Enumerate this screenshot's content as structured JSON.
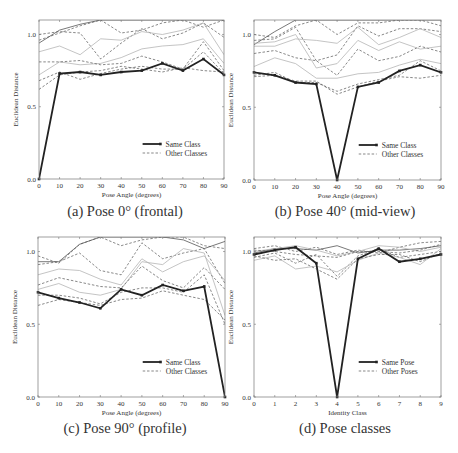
{
  "figure": {
    "captions": [
      "(a) Pose 0° (frontal)",
      "(b) Pose 40° (mid-view)",
      "(c) Pose 90° (profile)",
      "(d) Pose classes"
    ]
  },
  "chart_data": [
    {
      "type": "line",
      "title": "(a) Pose 0° (frontal)",
      "xlabel": "Pose Angle (degrees)",
      "ylabel": "Euclidean Distance",
      "x": [
        0,
        10,
        20,
        30,
        40,
        50,
        60,
        70,
        80,
        90
      ],
      "xticks": [
        "0",
        "10",
        "20",
        "30",
        "40",
        "50",
        "60",
        "70",
        "80",
        "90"
      ],
      "yticks": [
        "0.0",
        "0.5",
        "1.0"
      ],
      "ylim": [
        0,
        1.1
      ],
      "legend": [
        "Same Class",
        "Other Classes"
      ],
      "legend_position": "lower right",
      "grid": false,
      "series": [
        {
          "name": "Same Class",
          "style": "bold",
          "values": [
            0.0,
            0.73,
            0.74,
            0.72,
            0.74,
            0.75,
            0.8,
            0.75,
            0.83,
            0.72
          ]
        },
        {
          "name": "Other Classes",
          "style": "solid-dark",
          "values": [
            0.94,
            1.03,
            1.07,
            1.1,
            1.1,
            1.1,
            1.1,
            1.1,
            1.1,
            1.1
          ]
        },
        {
          "name": "Other Classes",
          "style": "dashed",
          "values": [
            1.0,
            1.02,
            1.01,
            0.83,
            0.94,
            1.04,
            0.97,
            1.01,
            1.08,
            0.98
          ]
        },
        {
          "name": "Other Classes",
          "style": "dashed",
          "values": [
            0.96,
            1.01,
            1.06,
            1.1,
            1.01,
            1.03,
            1.08,
            1.1,
            1.05,
            1.1
          ]
        },
        {
          "name": "Other Classes",
          "style": "light",
          "values": [
            0.88,
            0.92,
            0.86,
            0.97,
            0.96,
            1.02,
            1.0,
            1.03,
            1.08,
            0.86
          ]
        },
        {
          "name": "Other Classes",
          "style": "light",
          "values": [
            0.72,
            0.81,
            0.79,
            0.8,
            0.84,
            0.9,
            0.92,
            0.93,
            0.97,
            0.8
          ]
        },
        {
          "name": "Other Classes",
          "style": "dashed",
          "values": [
            0.81,
            0.81,
            0.82,
            0.79,
            0.8,
            0.85,
            0.81,
            0.76,
            0.95,
            0.75
          ]
        },
        {
          "name": "Other Classes",
          "style": "dashed",
          "values": [
            0.68,
            0.74,
            0.69,
            0.73,
            0.76,
            0.78,
            0.76,
            0.76,
            0.88,
            0.73
          ]
        },
        {
          "name": "Other Classes",
          "style": "dashed",
          "values": [
            0.62,
            0.72,
            0.74,
            0.75,
            0.78,
            0.76,
            0.74,
            0.77,
            0.75,
            0.74
          ]
        }
      ]
    },
    {
      "type": "line",
      "title": "(b) Pose 40° (mid-view)",
      "xlabel": "Pose Angle (degrees)",
      "ylabel": "Euclidean Distance",
      "x": [
        0,
        10,
        20,
        30,
        40,
        50,
        60,
        70,
        80,
        90
      ],
      "xticks": [
        "0",
        "10",
        "20",
        "30",
        "40",
        "50",
        "60",
        "70",
        "80",
        "90"
      ],
      "yticks": [
        "0.0",
        "0.5",
        "1.0"
      ],
      "ylim": [
        0,
        1.1
      ],
      "legend": [
        "Same Class",
        "Other Classes"
      ],
      "legend_position": "lower right",
      "grid": false,
      "series": [
        {
          "name": "Same Class",
          "style": "bold",
          "values": [
            0.74,
            0.72,
            0.67,
            0.66,
            0.0,
            0.64,
            0.67,
            0.75,
            0.79,
            0.74
          ]
        },
        {
          "name": "Other Classes",
          "style": "solid-dark",
          "values": [
            0.93,
            1.02,
            1.1,
            1.1,
            1.1,
            1.1,
            1.1,
            1.1,
            1.1,
            1.1
          ]
        },
        {
          "name": "Other Classes",
          "style": "dashed",
          "values": [
            1.0,
            0.98,
            1.06,
            1.1,
            1.0,
            1.08,
            1.08,
            1.1,
            1.1,
            1.06
          ]
        },
        {
          "name": "Other Classes",
          "style": "dashed",
          "values": [
            0.96,
            0.97,
            1.05,
            0.82,
            0.86,
            1.06,
            0.99,
            1.04,
            1.04,
            1.02
          ]
        },
        {
          "name": "Other Classes",
          "style": "light",
          "values": [
            0.92,
            0.92,
            0.97,
            0.96,
            0.94,
            1.05,
            0.93,
            0.98,
            1.04,
            0.98
          ]
        },
        {
          "name": "Other Classes",
          "style": "light",
          "values": [
            0.78,
            0.84,
            0.8,
            0.7,
            0.7,
            0.73,
            0.74,
            0.79,
            0.83,
            0.8
          ]
        },
        {
          "name": "Other Classes",
          "style": "dashed",
          "values": [
            0.87,
            0.89,
            0.84,
            0.82,
            0.72,
            0.9,
            0.82,
            0.85,
            0.92,
            0.88
          ]
        },
        {
          "name": "Other Classes",
          "style": "light",
          "values": [
            0.94,
            0.95,
            1.0,
            0.77,
            0.8,
            0.96,
            0.89,
            0.95,
            0.9,
            0.92
          ]
        },
        {
          "name": "Other Classes",
          "style": "dashed",
          "values": [
            0.72,
            0.74,
            0.67,
            0.67,
            0.61,
            0.66,
            0.69,
            0.72,
            0.82,
            0.75
          ]
        },
        {
          "name": "Other Classes",
          "style": "dashed",
          "values": [
            0.71,
            0.72,
            0.68,
            0.68,
            0.59,
            0.64,
            0.68,
            0.71,
            0.7,
            0.72
          ]
        }
      ]
    },
    {
      "type": "line",
      "title": "(c) Pose 90° (profile)",
      "xlabel": "Pose Angle (degrees)",
      "ylabel": "Euclidean Distance",
      "x": [
        0,
        10,
        20,
        30,
        40,
        50,
        60,
        70,
        80,
        90
      ],
      "xticks": [
        "0",
        "10",
        "20",
        "30",
        "40",
        "50",
        "60",
        "70",
        "80",
        "90"
      ],
      "yticks": [
        "0.0",
        "0.5",
        "1.0"
      ],
      "ylim": [
        0,
        1.1
      ],
      "legend": [
        "Same Class",
        "Other Classes"
      ],
      "legend_position": "lower right",
      "grid": false,
      "series": [
        {
          "name": "Same Class",
          "style": "bold",
          "values": [
            0.72,
            0.68,
            0.65,
            0.61,
            0.74,
            0.7,
            0.77,
            0.73,
            0.76,
            0.0
          ]
        },
        {
          "name": "Other Classes",
          "style": "solid-dark",
          "values": [
            0.93,
            0.93,
            1.05,
            1.1,
            1.1,
            1.1,
            1.1,
            1.08,
            1.02,
            1.07
          ]
        },
        {
          "name": "Other Classes",
          "style": "dashed",
          "values": [
            0.97,
            0.92,
            1.05,
            1.1,
            1.04,
            1.08,
            1.1,
            1.1,
            1.04,
            1.02
          ]
        },
        {
          "name": "Other Classes",
          "style": "dashed",
          "values": [
            0.91,
            0.93,
            0.99,
            0.87,
            0.84,
            1.06,
            0.95,
            0.99,
            1.02,
            0.78
          ]
        },
        {
          "name": "Other Classes",
          "style": "light",
          "values": [
            0.84,
            0.88,
            0.87,
            0.81,
            0.77,
            0.95,
            0.86,
            0.93,
            0.97,
            0.8
          ]
        },
        {
          "name": "Other Classes",
          "style": "light",
          "values": [
            0.74,
            0.78,
            0.72,
            0.7,
            0.74,
            0.93,
            0.91,
            1.02,
            0.99,
            0.56
          ]
        },
        {
          "name": "Other Classes",
          "style": "dashed",
          "values": [
            0.77,
            0.82,
            0.79,
            0.76,
            0.75,
            0.9,
            0.8,
            0.75,
            0.89,
            0.74
          ]
        },
        {
          "name": "Other Classes",
          "style": "dashed",
          "values": [
            0.7,
            0.7,
            0.68,
            0.64,
            0.72,
            0.75,
            0.75,
            0.72,
            0.84,
            0.5
          ]
        },
        {
          "name": "Other Classes",
          "style": "dashed",
          "values": [
            0.63,
            0.67,
            0.65,
            0.63,
            0.67,
            0.68,
            0.73,
            0.7,
            0.67,
            0.53
          ]
        }
      ]
    },
    {
      "type": "line",
      "title": "(d) Pose classes",
      "xlabel": "Identity Class",
      "ylabel": "Euclidean Distance",
      "x": [
        0,
        1,
        2,
        3,
        4,
        5,
        6,
        7,
        8,
        9
      ],
      "xticks": [
        "0",
        "1",
        "2",
        "3",
        "4",
        "5",
        "6",
        "7",
        "8",
        "9"
      ],
      "yticks": [
        "0.0",
        "0.5",
        "1.0"
      ],
      "ylim": [
        0,
        1.1
      ],
      "legend": [
        "Same Pose",
        "Other Poses"
      ],
      "legend_position": "lower right",
      "grid": false,
      "series": [
        {
          "name": "Same Pose",
          "style": "bold",
          "values": [
            0.98,
            1.01,
            1.03,
            0.92,
            0.0,
            0.95,
            1.02,
            0.93,
            0.95,
            0.98
          ]
        },
        {
          "name": "Other Poses",
          "style": "solid-dark",
          "values": [
            0.99,
            1.02,
            1.02,
            1.01,
            1.04,
            0.99,
            1.01,
            1.01,
            1.02,
            1.04
          ]
        },
        {
          "name": "Other Poses",
          "style": "dashed",
          "values": [
            1.02,
            1.04,
            1.0,
            1.03,
            0.98,
            1.01,
            0.99,
            1.03,
            1.06,
            1.07
          ]
        },
        {
          "name": "Other Poses",
          "style": "dashed",
          "values": [
            0.96,
            0.99,
            0.92,
            0.98,
            0.83,
            0.97,
            1.02,
            0.96,
            0.98,
            1.0
          ]
        },
        {
          "name": "Other Poses",
          "style": "light",
          "values": [
            0.94,
            0.97,
            0.88,
            0.9,
            0.86,
            0.94,
            0.99,
            0.96,
            0.91,
            1.02
          ]
        },
        {
          "name": "Other Poses",
          "style": "light",
          "values": [
            1.0,
            1.02,
            1.04,
            1.01,
            0.97,
            1.0,
            1.04,
            1.03,
            1.0,
            1.03
          ]
        },
        {
          "name": "Other Poses",
          "style": "dashed",
          "values": [
            0.97,
            0.94,
            0.95,
            0.88,
            0.81,
            0.95,
            0.98,
            0.98,
            0.93,
            0.99
          ]
        },
        {
          "name": "Other Poses",
          "style": "dashed",
          "values": [
            1.01,
            1.0,
            0.98,
            0.97,
            0.96,
            1.0,
            1.0,
            0.99,
            1.01,
            1.05
          ]
        }
      ]
    }
  ]
}
